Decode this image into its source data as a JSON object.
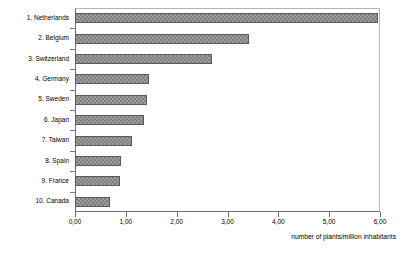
{
  "chart_data": {
    "type": "bar",
    "orientation": "horizontal",
    "title": "",
    "subtitle": "",
    "xlabel": "number of plants/million inhabitants",
    "ylabel": "",
    "xlim": [
      0,
      6
    ],
    "grid": false,
    "legend": null,
    "decimal_separator": ",",
    "bar_color": "#808080",
    "bar_edge_color": "#5a5a5a",
    "categories": [
      "1. Netherlands",
      "2. Belgium",
      "3. Switzerland",
      "4. Germany",
      "5. Sweden",
      "6. Japan",
      "7. Taiwan",
      "8. Spain",
      "9. France",
      "10. Canada"
    ],
    "values": [
      5.97,
      3.43,
      2.69,
      1.45,
      1.41,
      1.35,
      1.13,
      0.91,
      0.89,
      0.69
    ],
    "xticks": [
      0,
      1,
      2,
      3,
      4,
      5,
      6
    ],
    "xtick_labels": [
      "0,00",
      "1,00",
      "2,00",
      "3,00",
      "4,00",
      "5,00",
      "6,00"
    ]
  }
}
